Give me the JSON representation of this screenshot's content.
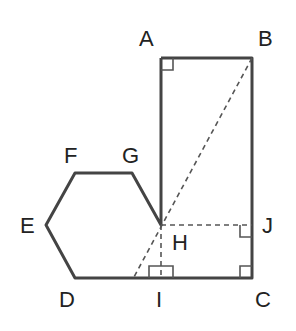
{
  "diagram": {
    "points": {
      "A": {
        "label": "A",
        "x": 161,
        "y": 58
      },
      "B": {
        "label": "B",
        "x": 252,
        "y": 58
      },
      "C": {
        "label": "C",
        "x": 252,
        "y": 278
      },
      "D": {
        "label": "D",
        "x": 75,
        "y": 278
      },
      "E": {
        "label": "E",
        "x": 46,
        "y": 225
      },
      "F": {
        "label": "F",
        "x": 75,
        "y": 173
      },
      "G": {
        "label": "G",
        "x": 132,
        "y": 173
      },
      "H": {
        "label": "H",
        "x": 161,
        "y": 225
      },
      "I": {
        "label": "I",
        "x": 161,
        "y": 278
      },
      "J": {
        "label": "J",
        "x": 252,
        "y": 225
      }
    },
    "right_angle_marks": [
      "A",
      "J",
      "C",
      "I"
    ],
    "colors": {
      "line": "#444444",
      "text": "#222222"
    }
  }
}
